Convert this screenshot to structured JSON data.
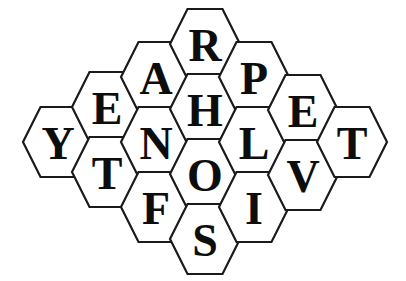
{
  "puzzle": {
    "type": "hexagonal-letter-grid",
    "orientation": "flat-top",
    "canvas": {
      "width": 406,
      "height": 281,
      "background": "#ffffff"
    },
    "style": {
      "cell_fill": "#ffffff",
      "cell_stroke": "#1a1a1a",
      "cell_stroke_width": 2.2,
      "letter_color": "#0d0d0d",
      "letter_font_size": 46
    },
    "geometry": {
      "cell_width": 70,
      "cell_height": 70,
      "column_pitch": 49,
      "row_pitch": 65
    },
    "cell_count": 18,
    "columns": [
      {
        "name": "column-1",
        "center_x": 58,
        "letters": [
          "Y"
        ]
      },
      {
        "name": "column-2",
        "center_x": 107,
        "letters": [
          "E",
          "T"
        ]
      },
      {
        "name": "column-3",
        "center_x": 156,
        "letters": [
          "A",
          "N",
          "F"
        ]
      },
      {
        "name": "column-4",
        "center_x": 205,
        "letters": [
          "R",
          "H",
          "O",
          "S"
        ]
      },
      {
        "name": "column-5",
        "center_x": 254,
        "letters": [
          "P",
          "L",
          "I"
        ]
      },
      {
        "name": "column-6",
        "center_x": 303,
        "letters": [
          "E",
          "V"
        ]
      },
      {
        "name": "column-7",
        "center_x": 352,
        "letters": [
          "T"
        ]
      }
    ],
    "cells": [
      {
        "id": "cell-y",
        "letter": "Y",
        "cx": 58,
        "cy": 142
      },
      {
        "id": "cell-e1",
        "letter": "E",
        "cx": 107,
        "cy": 107
      },
      {
        "id": "cell-t1",
        "letter": "T",
        "cx": 107,
        "cy": 172
      },
      {
        "id": "cell-a",
        "letter": "A",
        "cx": 156,
        "cy": 77
      },
      {
        "id": "cell-n",
        "letter": "N",
        "cx": 156,
        "cy": 142
      },
      {
        "id": "cell-f",
        "letter": "F",
        "cx": 156,
        "cy": 207
      },
      {
        "id": "cell-r",
        "letter": "R",
        "cx": 205,
        "cy": 44
      },
      {
        "id": "cell-h",
        "letter": "H",
        "cx": 205,
        "cy": 109
      },
      {
        "id": "cell-o",
        "letter": "O",
        "cx": 205,
        "cy": 174
      },
      {
        "id": "cell-s",
        "letter": "S",
        "cx": 205,
        "cy": 239
      },
      {
        "id": "cell-p",
        "letter": "P",
        "cx": 254,
        "cy": 77
      },
      {
        "id": "cell-l",
        "letter": "L",
        "cx": 254,
        "cy": 142
      },
      {
        "id": "cell-i",
        "letter": "I",
        "cx": 254,
        "cy": 207
      },
      {
        "id": "cell-e2",
        "letter": "E",
        "cx": 303,
        "cy": 110
      },
      {
        "id": "cell-v",
        "letter": "V",
        "cx": 303,
        "cy": 175
      },
      {
        "id": "cell-t2",
        "letter": "T",
        "cx": 352,
        "cy": 142
      }
    ],
    "letters_flat": [
      "Y",
      "E",
      "T",
      "A",
      "N",
      "F",
      "R",
      "H",
      "O",
      "S",
      "P",
      "L",
      "I",
      "E",
      "V",
      "T"
    ]
  }
}
